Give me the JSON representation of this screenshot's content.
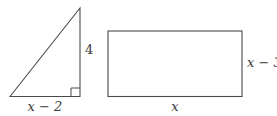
{
  "figure": {
    "triangle": {
      "height_label": "4",
      "base_label": "x − 2"
    },
    "rectangle": {
      "side_label": "x − 3",
      "base_label": "x"
    },
    "colors": {
      "line": "#4a4a4a",
      "text": "#3a3a3a",
      "background": "#ffffff"
    }
  }
}
